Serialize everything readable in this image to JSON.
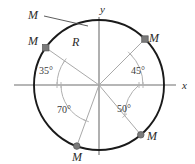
{
  "figure": {
    "background_color": "#ffffff",
    "circle_color": "#1a1a1a",
    "axis_color": "#6f6f6f",
    "radius_line_color": "#a9a9a9",
    "arc_color": "#b0b0b0",
    "marker_color": "#7a7a7a",
    "text_color": "#2b2b2b"
  },
  "axes": {
    "x_label": "x",
    "y_label": "y",
    "origin": {
      "x": 99,
      "y": 85
    },
    "x_start": 14,
    "x_end": 176,
    "y_start": 17,
    "y_end": 155
  },
  "circle": {
    "center_x": 99,
    "center_y": 85,
    "radius": 65,
    "radius_label": "R"
  },
  "points": [
    {
      "label": "M",
      "angle_deg": 145,
      "angle_label": "35°",
      "marker_shape": "square",
      "label_x": 33,
      "label_y": 45,
      "quadrant": "upper-left"
    },
    {
      "label": "M",
      "angle_deg": 45,
      "angle_label": "45°",
      "marker_shape": "square",
      "label_x": 154,
      "label_y": 42,
      "quadrant": "upper-right"
    },
    {
      "label": "M",
      "angle_deg": 250,
      "angle_label": "70°",
      "marker_shape": "circle",
      "label_x": 77,
      "label_y": 161,
      "quadrant": "lower-left"
    },
    {
      "label": "M",
      "angle_deg": 310,
      "angle_label": "50°",
      "marker_shape": "circle",
      "label_x": 152,
      "label_y": 140,
      "quadrant": "lower-right"
    }
  ],
  "angle_labels": [
    {
      "text": "35°",
      "x": 46,
      "y": 74
    },
    {
      "text": "45°",
      "x": 138,
      "y": 74
    },
    {
      "text": "70°",
      "x": 64,
      "y": 113
    },
    {
      "text": "50°",
      "x": 124,
      "y": 112
    }
  ],
  "callout": {
    "label": "M",
    "label_x": 33,
    "label_y": 19,
    "leader_from_x": 44,
    "leader_from_y": 16,
    "leader_to_x": 88,
    "leader_to_y": 26
  },
  "radius_label": {
    "text": "R",
    "x": 72,
    "y": 46
  }
}
